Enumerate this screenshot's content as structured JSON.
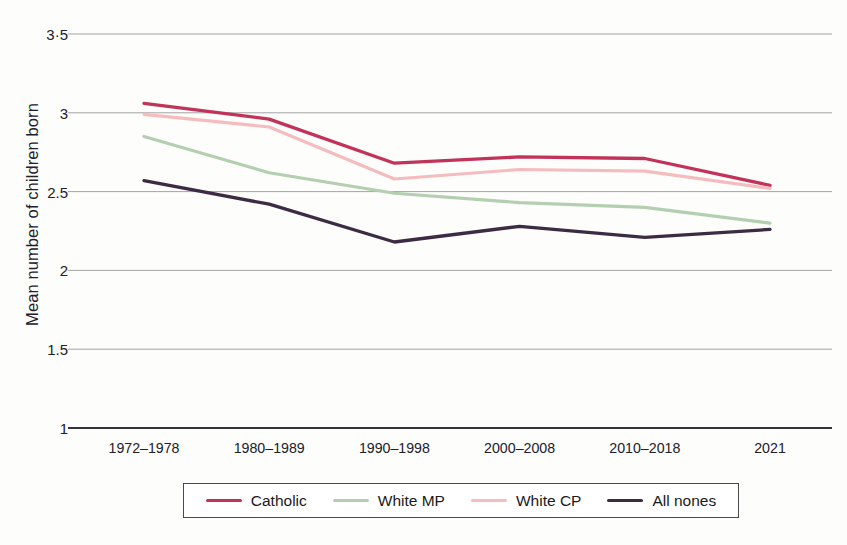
{
  "chart_data": {
    "type": "line",
    "title": "",
    "xlabel": "",
    "ylabel": "Mean number of children born",
    "categories": [
      "1972–1978",
      "1980–1989",
      "1990–1998",
      "2000–2008",
      "2010–2018",
      "2021"
    ],
    "yticks": [
      "1",
      "1.5",
      "2",
      "2.5",
      "3",
      "3·5"
    ],
    "ytick_values": [
      1,
      1.5,
      2,
      2.5,
      3,
      3.5
    ],
    "ylim": [
      1,
      3.5
    ],
    "grid": true,
    "legend_position": "bottom",
    "series": [
      {
        "name": "Catholic",
        "color": "#c2335a",
        "width": 3.3,
        "values": [
          3.06,
          2.96,
          2.68,
          2.72,
          2.71,
          2.54
        ]
      },
      {
        "name": "White MP",
        "color": "#b3cfb0",
        "width": 3.1,
        "values": [
          2.85,
          2.62,
          2.49,
          2.43,
          2.4,
          2.3
        ]
      },
      {
        "name": "White CP",
        "color": "#f5bcbe",
        "width": 3.1,
        "values": [
          2.99,
          2.91,
          2.58,
          2.64,
          2.63,
          2.52
        ]
      },
      {
        "name": "All nones",
        "color": "#3d2b43",
        "width": 3.3,
        "values": [
          2.57,
          2.42,
          2.18,
          2.28,
          2.21,
          2.26
        ]
      }
    ]
  },
  "legend": {
    "items": [
      {
        "label": "Catholic",
        "color": "#c2335a"
      },
      {
        "label": "White MP",
        "color": "#b3cfb0"
      },
      {
        "label": "White CP",
        "color": "#f5bcbe"
      },
      {
        "label": "All nones",
        "color": "#3d2b43"
      }
    ]
  },
  "style": {
    "gridline_color": "#9a9a9a",
    "axis_color": "#33333a",
    "background": "#fdfdfc"
  }
}
